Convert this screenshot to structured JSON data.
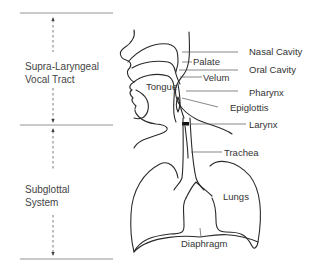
{
  "sections": [
    {
      "id": "supra",
      "lines": [
        "Supra-Laryngeal",
        "Vocal Tract"
      ]
    },
    {
      "id": "subglottal",
      "lines": [
        "Subglottal",
        "System"
      ]
    }
  ],
  "labels": {
    "nasal_cavity": "Nasal Cavity",
    "palate": "Palate",
    "oral_cavity": "Oral Cavity",
    "velum": "Velum",
    "tongue": "Tongue",
    "pharynx": "Pharynx",
    "epiglottis": "Epiglottis",
    "larynx": "Larynx",
    "trachea": "Trachea",
    "lungs": "Lungs",
    "diaphragm": "Diaphragm"
  },
  "colors": {
    "line": "#2a2a2a",
    "text": "#333333",
    "divider": "#888888"
  }
}
